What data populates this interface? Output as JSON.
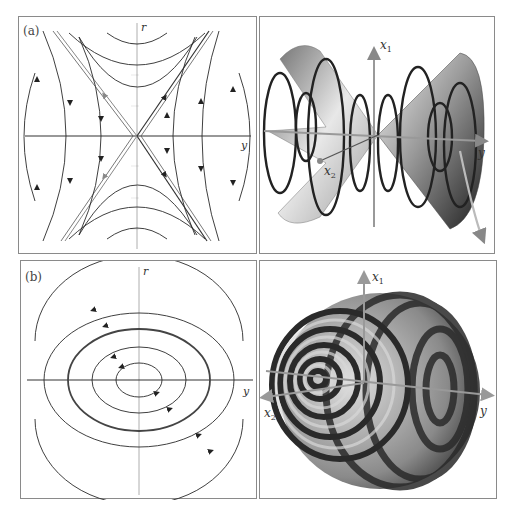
{
  "figure": {
    "panels": [
      {
        "id": "a",
        "label": "(a)",
        "type": "phase-portrait",
        "description": "Saddle point phase portrait",
        "axes": {
          "horizontal": "y",
          "vertical": "r"
        }
      },
      {
        "id": "a-3d",
        "type": "3d-surface",
        "description": "Double cone with helical trajectories",
        "axes": {
          "x1": "x",
          "x1_sub": "1",
          "x2": "x",
          "x2_sub": "2",
          "y": "y"
        }
      },
      {
        "id": "b",
        "label": "(b)",
        "type": "phase-portrait",
        "description": "Center phase portrait with concentric closed orbits",
        "axes": {
          "horizontal": "y",
          "vertical": "r"
        }
      },
      {
        "id": "b-3d",
        "type": "3d-surface",
        "description": "Nested toroidal/spherical invariant surfaces with striped shading",
        "axes": {
          "x1": "x",
          "x1_sub": "1",
          "x2": "x",
          "x2_sub": "2",
          "y": "y"
        }
      }
    ]
  },
  "colors": {
    "curve": "#2a2a2a",
    "axis": "#333333",
    "separatrix_gray": "#8c8c8c",
    "frame": "#8a8a8a",
    "axis3d": "#9a9a9a"
  }
}
